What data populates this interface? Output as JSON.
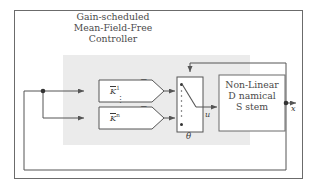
{
  "diagram": {
    "title_lines": [
      "Gain-scheduled",
      "Mean-Field-Free",
      "Controller"
    ],
    "controller_region_label": "gain-scheduled-controller-region",
    "gain_blocks": [
      {
        "label_base": "K",
        "label_overbar": true,
        "superscript": "1"
      },
      {
        "label_base": "K",
        "label_overbar": true,
        "superscript": "n"
      }
    ],
    "vertical_ellipsis": "⋮",
    "minus_signs": [
      "−",
      "−"
    ],
    "switch": {
      "name": "gain-scheduling-switch",
      "parameter_label": "θ",
      "input_count": 2,
      "contact_dots": 2,
      "dotted_rail": "⋮"
    },
    "plant": {
      "lines": [
        "Non-Linear",
        "D namical",
        "S stem"
      ]
    },
    "signals": {
      "control_input": "u",
      "state_output": "x"
    },
    "colors": {
      "line": "#555555",
      "text": "#3a3a3a",
      "shade": "#ebebeb",
      "background": "#ffffff",
      "border": "#6b6b6b"
    }
  }
}
